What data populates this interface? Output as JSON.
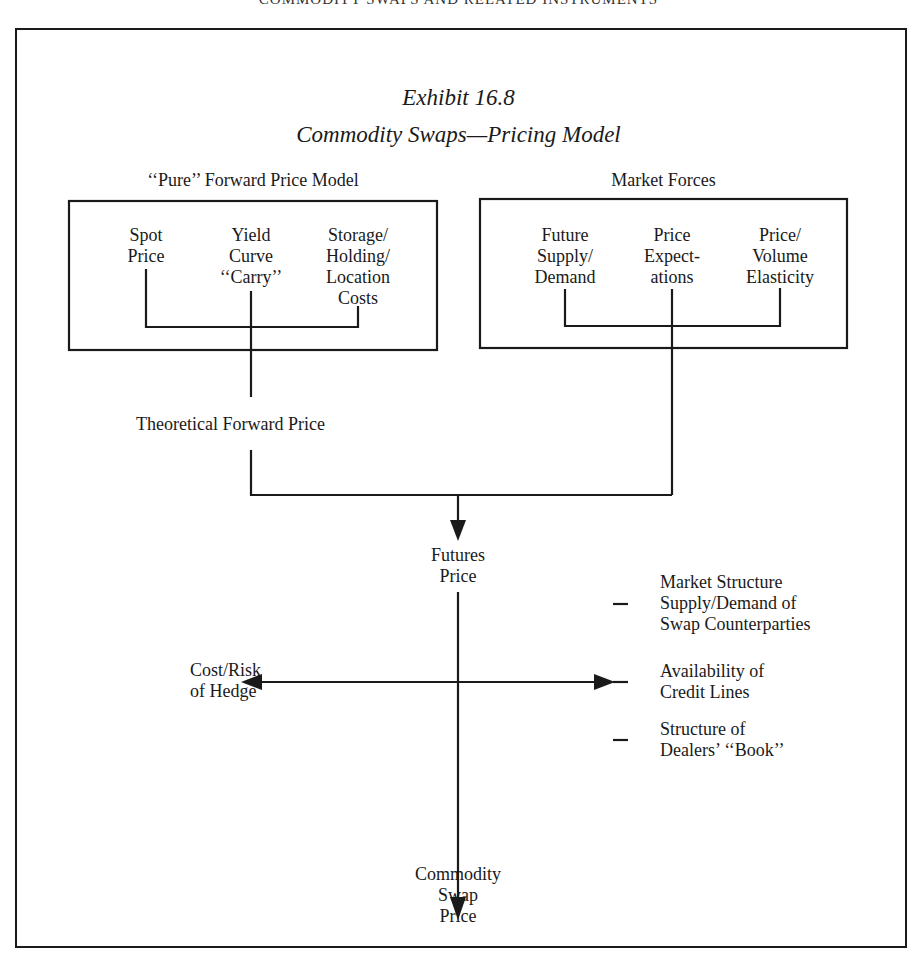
{
  "page": {
    "running_head": "COMMODITY SWAPS AND RELATED INSTRUMENTS"
  },
  "exhibit": {
    "number": "Exhibit 16.8",
    "title": "Commodity Swaps—Pricing Model"
  },
  "pure_model": {
    "label": "‘‘Pure’’ Forward Price Model",
    "items": [
      {
        "lines": [
          "Spot",
          "Price"
        ]
      },
      {
        "lines": [
          "Yield",
          "Curve",
          "‘‘Carry’’"
        ]
      },
      {
        "lines": [
          "Storage/",
          "Holding/",
          "Location",
          "Costs"
        ]
      }
    ]
  },
  "market_forces": {
    "label": "Market Forces",
    "items": [
      {
        "lines": [
          "Future",
          "Supply/",
          "Demand"
        ]
      },
      {
        "lines": [
          "Price",
          "Expect-",
          "ations"
        ]
      },
      {
        "lines": [
          "Price/",
          "Volume",
          "Elasticity"
        ]
      }
    ]
  },
  "theoretical_forward_price": "Theoretical Forward Price",
  "futures_price": {
    "lines": [
      "Futures",
      "Price"
    ]
  },
  "cost_risk_hedge": {
    "lines": [
      "Cost/Risk",
      "of Hedge"
    ]
  },
  "right_factors": [
    {
      "lines": [
        "Market Structure",
        "Supply/Demand of",
        "Swap Counterparties"
      ]
    },
    {
      "lines": [
        "Availability of",
        "Credit Lines"
      ]
    },
    {
      "lines": [
        "Structure of",
        "Dealers’ ‘‘Book’’"
      ]
    }
  ],
  "commodity_swap_price": {
    "lines": [
      "Commodity",
      "Swap",
      "Price"
    ]
  },
  "colors": {
    "ink": "#1a1a1a",
    "paper": "#ffffff"
  }
}
